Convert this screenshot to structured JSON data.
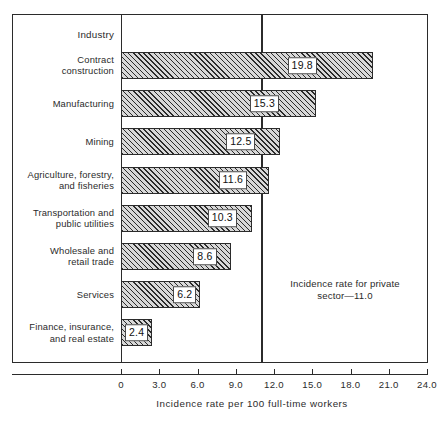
{
  "chart_data": {
    "type": "bar",
    "orientation": "horizontal",
    "title": "",
    "xlabel": "Incidence rate per 100 full-time workers",
    "ylabel": "Industry",
    "xlim": [
      0,
      24.0
    ],
    "xticks": [
      "0",
      "3.0",
      "6.0",
      "9.0",
      "12.0",
      "15.0",
      "18.0",
      "21.0",
      "24.0"
    ],
    "xtick_values": [
      0,
      3,
      6,
      9,
      12,
      15,
      18,
      21,
      24
    ],
    "grid": false,
    "legend": null,
    "categories": [
      "Contract construction",
      "Manufacturing",
      "Mining",
      "Agriculture, forestry, and fisheries",
      "Transportation and public utilities",
      "Wholesale and retail trade",
      "Services",
      "Finance, insurance, and real estate"
    ],
    "values": [
      19.8,
      15.3,
      12.5,
      11.6,
      10.3,
      8.6,
      6.2,
      2.4
    ],
    "data_labels": [
      "19.8",
      "15.3",
      "12.5",
      "11.6",
      "10.3",
      "8.6",
      "6.2",
      "2.4"
    ],
    "reference_line": {
      "value": 11.0,
      "label_line1": "Incidence rate for private",
      "label_line2": "sector—11.0"
    },
    "colors": {
      "bar_fill": "#d8d8d8",
      "bar_hatch": "#2b2b2b",
      "bar_border": "#2b2b2b",
      "axis": "#2b2b2b",
      "background": "#ffffff",
      "text": "#2b2b2b"
    }
  },
  "categories_display": [
    {
      "line1": "Contract",
      "line2": "construction"
    },
    {
      "line1": "Manufacturing",
      "line2": ""
    },
    {
      "line1": "Mining",
      "line2": ""
    },
    {
      "line1": "Agriculture, forestry,",
      "line2": "and fisheries"
    },
    {
      "line1": "Transportation and",
      "line2": "public utilities"
    },
    {
      "line1": "Wholesale and",
      "line2": "retail trade"
    },
    {
      "line1": "Services",
      "line2": ""
    },
    {
      "line1": "Finance, insurance,",
      "line2": "and real estate"
    }
  ],
  "header": {
    "industry_label": "Industry"
  },
  "annotation": {
    "line1": "Incidence rate for private",
    "line2": "sector—11.0"
  },
  "axis": {
    "title": "Incidence rate per 100 full-time workers",
    "ticks": [
      "0",
      "3.0",
      "6.0",
      "9.0",
      "12.0",
      "15.0",
      "18.0",
      "21.0",
      "24.0"
    ]
  }
}
